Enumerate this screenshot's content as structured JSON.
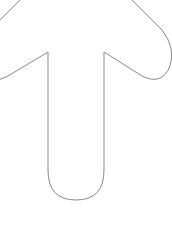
{
  "icon": {
    "name": "arrow-up-icon",
    "stroke_color": "#8a8a8a",
    "fill_color": "#ffffff",
    "background": "#ffffff"
  }
}
